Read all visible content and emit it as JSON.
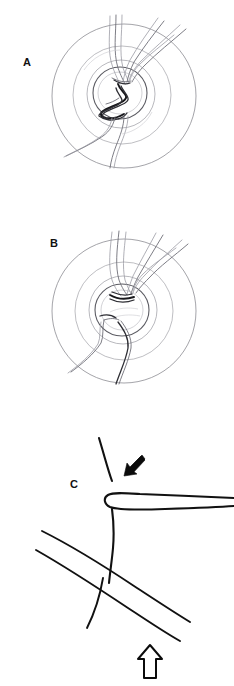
{
  "figure": {
    "background_color": "#ffffff",
    "width": 234,
    "height": 686
  },
  "panels": [
    {
      "id": "a",
      "label": "A",
      "label_x": 27,
      "label_y": 66,
      "kind": "fundus-drawing",
      "description": "Fundus drawing showing a tortuous coiled dark vessel loop overlying the optic disc",
      "circle": {
        "cx": 124,
        "cy": 96,
        "r_outer": 72,
        "r_mid": 49,
        "r_inner": 34
      },
      "disc": {
        "cx": 120,
        "cy": 93,
        "rx": 27,
        "ry": 26
      }
    },
    {
      "id": "b",
      "label": "B",
      "label_x": 54,
      "label_y": 247,
      "kind": "fundus-drawing",
      "description": "Fundus drawing after resolution showing a flattened smooth vessel course at the optic disc",
      "circle": {
        "cx": 124,
        "cy": 311,
        "r_outer": 72,
        "r_mid": 49,
        "r_inner": 34
      },
      "disc": {
        "cx": 122,
        "cy": 310,
        "rx": 27,
        "ry": 26
      }
    },
    {
      "id": "c",
      "label": "C",
      "label_x": 74,
      "label_y": 488,
      "kind": "schematic-diagram",
      "description": "Schematic of a vessel crossing: horizontal vessel loops over a vertical vessel (black arrow) while a diagonal vessel crosses beneath (open arrow)"
    }
  ],
  "annotations": [
    {
      "name": "black-arrow",
      "style": "solid-black",
      "points_to": "vessel loop crossing over the vertical vessel",
      "direction": "down-left",
      "x": 131,
      "y": 479
    },
    {
      "name": "white-arrow",
      "style": "open-outline",
      "points_to": "diagonal vessel crossing beneath",
      "direction": "up",
      "x": 150,
      "y": 665
    }
  ],
  "colors": {
    "ink": "#111111",
    "vessel_dark": "#2e2e34",
    "vessel_light": "#9c9ca4",
    "ring": "#8d8d93",
    "background": "#ffffff"
  }
}
